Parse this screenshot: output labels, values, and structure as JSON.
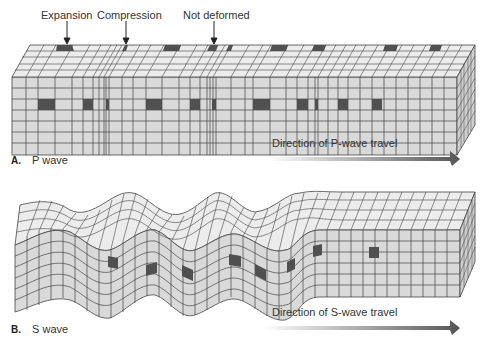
{
  "panel_a": {
    "letter": "A.",
    "title": "P wave",
    "callouts": [
      "Expansion",
      "Compression",
      "Not deformed"
    ],
    "direction_label": "Direction of P-wave travel"
  },
  "panel_b": {
    "letter": "B.",
    "title": "S wave",
    "direction_label": "Direction of S-wave travel"
  },
  "colors": {
    "face": "#d9d9d9",
    "top": "#ececec",
    "grid": "#444444",
    "marker": "#555555",
    "arrow_dark": "#555555"
  }
}
